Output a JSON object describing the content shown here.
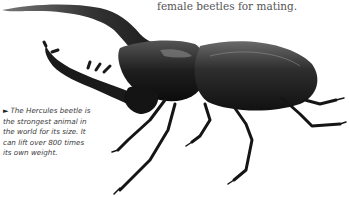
{
  "body_text": {
    "line": "female beetles for mating."
  },
  "caption": {
    "marker": "►",
    "lines": [
      "The Hercules beetle is",
      "the strongest animal in",
      "the world for its size. It",
      "can lift over 800 times",
      "its own weight."
    ]
  },
  "image": {
    "subject": "Hercules beetle illustration"
  }
}
